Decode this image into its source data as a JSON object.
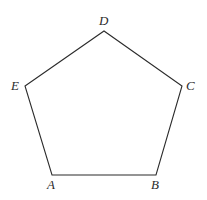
{
  "figure": {
    "shape_name": "pentagon",
    "background_color": "#ffffff",
    "stroke_color": "#2b2b2b",
    "stroke_width": 1.1,
    "fill": "none",
    "label_style": "italic-serif",
    "label_color": "#2b2b2b",
    "label_font_size": 13,
    "canvas": {
      "width": 207,
      "height": 200
    },
    "vertices": [
      {
        "id": "A",
        "label": "A",
        "x": 52,
        "y": 175,
        "label_x": 47,
        "label_y": 178,
        "label_position": "below-left"
      },
      {
        "id": "B",
        "label": "B",
        "x": 156,
        "y": 175,
        "label_x": 151,
        "label_y": 178,
        "label_position": "below-left"
      },
      {
        "id": "C",
        "label": "C",
        "x": 182,
        "y": 86,
        "label_x": 186,
        "label_y": 79,
        "label_position": "right"
      },
      {
        "id": "D",
        "label": "D",
        "x": 104,
        "y": 31,
        "label_x": 99,
        "label_y": 14,
        "label_position": "above"
      },
      {
        "id": "E",
        "label": "E",
        "x": 25,
        "y": 86,
        "label_x": 11,
        "label_y": 79,
        "label_position": "left"
      }
    ],
    "edges": [
      {
        "id": "AB",
        "from": "A",
        "to": "B"
      },
      {
        "id": "BC",
        "from": "B",
        "to": "C"
      },
      {
        "id": "CD",
        "from": "C",
        "to": "D"
      },
      {
        "id": "DE",
        "from": "D",
        "to": "E"
      },
      {
        "id": "EA",
        "from": "E",
        "to": "A"
      }
    ],
    "polygon_points": "52,175 156,175 182,86 104,31 25,86"
  }
}
